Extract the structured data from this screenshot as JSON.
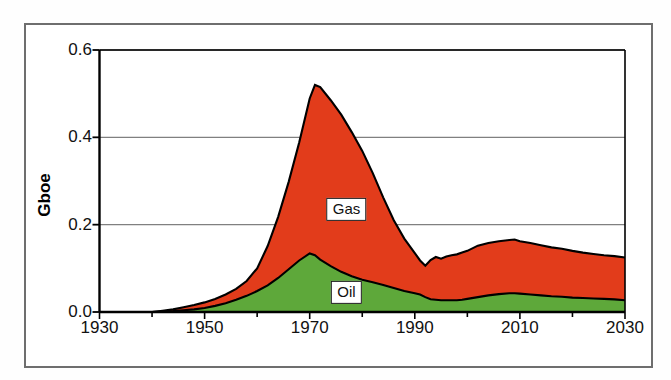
{
  "figure": {
    "width": 671,
    "height": 380,
    "background": "#ffffff",
    "frame_color": "#6e6e6e"
  },
  "axis_labels": {
    "ylabel": "Gboe",
    "ytick_labels": [
      "0.0",
      "0.2",
      "0.4",
      "0.6"
    ],
    "xtick_labels": [
      "1930",
      "1950",
      "1970",
      "1990",
      "2010",
      "2030"
    ]
  },
  "annotations": [
    {
      "text": "Gas",
      "x": 1977,
      "y": 0.235
    },
    {
      "text": "Oil",
      "x": 1977,
      "y": 0.045
    }
  ],
  "chart_data": {
    "type": "area",
    "stacked": true,
    "title": "",
    "xlabel": "",
    "ylabel": "Gboe",
    "xlim": [
      1930,
      2030
    ],
    "ylim": [
      0.0,
      0.6
    ],
    "yticks": [
      0.0,
      0.2,
      0.4,
      0.6
    ],
    "xticks": [
      1930,
      1950,
      1970,
      1990,
      2010,
      2030
    ],
    "xtick_minor_interval": 10,
    "grid": "horizontal",
    "grid_color": "#808080",
    "legend": "inline-labels",
    "colors": {
      "Gas": "#e23c1b",
      "Oil": "#5ea83a",
      "outline": "#000000"
    },
    "x": [
      1930,
      1935,
      1940,
      1942,
      1944,
      1946,
      1948,
      1950,
      1952,
      1954,
      1956,
      1958,
      1960,
      1962,
      1964,
      1966,
      1968,
      1970,
      1971,
      1972,
      1974,
      1976,
      1978,
      1980,
      1982,
      1984,
      1986,
      1988,
      1990,
      1991,
      1992,
      1993,
      1994,
      1995,
      1996,
      1997,
      1998,
      1999,
      2000,
      2002,
      2004,
      2006,
      2008,
      2009,
      2010,
      2012,
      2014,
      2016,
      2018,
      2020,
      2022,
      2024,
      2026,
      2028,
      2030
    ],
    "series": [
      {
        "name": "Oil",
        "values": [
          0.0,
          0.0,
          0.0,
          0.001,
          0.002,
          0.004,
          0.006,
          0.009,
          0.014,
          0.02,
          0.028,
          0.037,
          0.048,
          0.061,
          0.078,
          0.098,
          0.118,
          0.134,
          0.13,
          0.12,
          0.105,
          0.092,
          0.082,
          0.074,
          0.068,
          0.062,
          0.055,
          0.048,
          0.043,
          0.04,
          0.034,
          0.029,
          0.028,
          0.027,
          0.027,
          0.027,
          0.027,
          0.028,
          0.03,
          0.034,
          0.038,
          0.041,
          0.043,
          0.043,
          0.042,
          0.04,
          0.038,
          0.036,
          0.035,
          0.033,
          0.032,
          0.031,
          0.03,
          0.029,
          0.027
        ]
      },
      {
        "name": "Gas",
        "values": [
          0.0,
          0.0,
          0.0,
          0.002,
          0.004,
          0.007,
          0.01,
          0.013,
          0.016,
          0.02,
          0.025,
          0.034,
          0.052,
          0.09,
          0.14,
          0.2,
          0.27,
          0.355,
          0.39,
          0.395,
          0.38,
          0.36,
          0.33,
          0.295,
          0.25,
          0.2,
          0.155,
          0.12,
          0.092,
          0.078,
          0.072,
          0.09,
          0.098,
          0.095,
          0.1,
          0.103,
          0.105,
          0.108,
          0.11,
          0.118,
          0.12,
          0.121,
          0.122,
          0.123,
          0.12,
          0.118,
          0.115,
          0.112,
          0.11,
          0.107,
          0.104,
          0.102,
          0.1,
          0.099,
          0.098
        ]
      }
    ],
    "totals_note": "Gas values are the stacked increment above Oil; total peak is about 0.52 Gboe near 1971"
  }
}
